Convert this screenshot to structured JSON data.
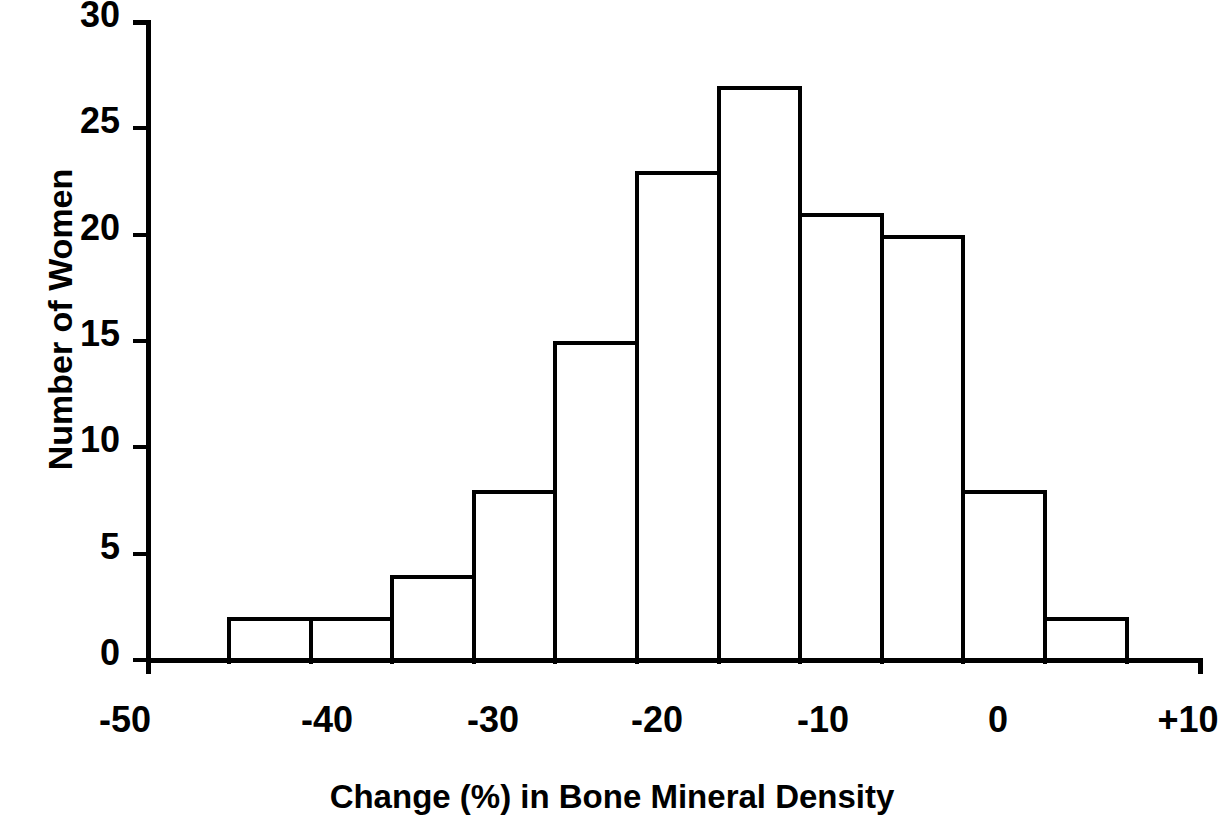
{
  "chart_data": {
    "type": "bar",
    "title": "",
    "xlabel": "Change (%) in Bone Mineral Density",
    "ylabel": "Number of Women",
    "categories": [
      "-45 to -40",
      "-40 to -35",
      "-35 to -30",
      "-30 to -25",
      "-25 to -20",
      "-20 to -15",
      "-15 to -10",
      "-10 to -5",
      "-5 to 0",
      "0 to 5",
      "5 to 10"
    ],
    "bin_centers": [
      -43,
      -38,
      -33,
      -28,
      -23,
      -18,
      -13,
      -8,
      -3,
      2,
      7
    ],
    "values": [
      2,
      2,
      4,
      8,
      15,
      23,
      27,
      21,
      20,
      8,
      2
    ],
    "bin_width": 5,
    "xlim": [
      -50,
      10
    ],
    "ylim": [
      0,
      30
    ],
    "xticks": [
      "-50",
      "-40",
      "-30",
      "-20",
      "-10",
      "0",
      "+10"
    ],
    "yticks": [
      "0",
      "5",
      "10",
      "15",
      "20",
      "25",
      "30"
    ],
    "grid": false,
    "legend": false,
    "bar_fill": "#ffffff",
    "bar_stroke": "#000000",
    "axis_color": "#000000"
  },
  "axes": {
    "y_title": "Number of Women",
    "x_title": "Change (%) in Bone Mineral Density",
    "y_ticks": [
      {
        "label": "30",
        "value": 30
      },
      {
        "label": "25",
        "value": 25
      },
      {
        "label": "20",
        "value": 20
      },
      {
        "label": "15",
        "value": 15
      },
      {
        "label": "10",
        "value": 10
      },
      {
        "label": "5",
        "value": 5
      },
      {
        "label": "0",
        "value": 0
      }
    ],
    "x_ticks": [
      {
        "label": "-50",
        "value": -50
      },
      {
        "label": "-40",
        "value": -40
      },
      {
        "label": "-30",
        "value": -30
      },
      {
        "label": "-20",
        "value": -20
      },
      {
        "label": "-10",
        "value": -10
      },
      {
        "label": "0",
        "value": 0
      },
      {
        "label": "+10",
        "value": 10
      }
    ]
  }
}
